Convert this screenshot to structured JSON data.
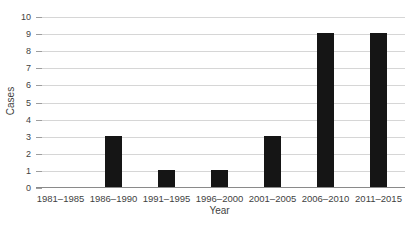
{
  "chart_data": {
    "type": "bar",
    "title": "",
    "categories": [
      "1981–1985",
      "1986–1990",
      "1991–1995",
      "1996–2000",
      "2001–2005",
      "2006–2010",
      "2011–2015"
    ],
    "values": [
      0,
      3,
      1,
      1,
      3,
      9,
      9
    ],
    "xlabel": "Year",
    "ylabel": "Cases",
    "ylim": [
      0,
      10
    ],
    "yticks": [
      0,
      1,
      2,
      3,
      4,
      5,
      6,
      7,
      8,
      9,
      10
    ],
    "grid": "horizontal",
    "legend_position": "none",
    "colors": {
      "bar": "#151515",
      "gridline": "#d6d6d6",
      "axis_line": "#8a8a8a",
      "tick": "#9e9e9e",
      "text": "#3f3f3f",
      "background": "#ffffff"
    }
  }
}
